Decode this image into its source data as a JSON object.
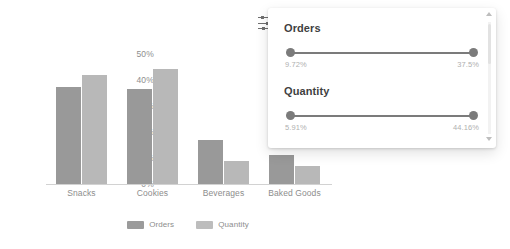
{
  "chart_data": {
    "type": "bar",
    "title": "",
    "xlabel": "",
    "ylabel": "",
    "categories": [
      "Snacks",
      "Cookies",
      "Beverages",
      "Baked Goods"
    ],
    "series": [
      {
        "name": "Orders",
        "color": "#999999",
        "values": [
          37.5,
          36.5,
          17.0,
          11.0
        ]
      },
      {
        "name": "Quantity",
        "color": "#b8b8b8",
        "values": [
          42.0,
          44.16,
          9.0,
          7.0
        ]
      }
    ],
    "ylim": [
      0,
      50
    ],
    "yticks": [
      "0%",
      "10%",
      "20%",
      "30%",
      "40%",
      "50%"
    ],
    "grid": false,
    "legend_position": "bottom"
  },
  "legend": {
    "items": [
      {
        "label": "Orders",
        "color": "#9b9b9b"
      },
      {
        "label": "Quantity",
        "color": "#bdbdbd"
      }
    ]
  },
  "filter_panel": {
    "icon": "filter-sliders-icon",
    "filters": [
      {
        "title": "Orders",
        "min_label": "9.72%",
        "max_label": "37.5%"
      },
      {
        "title": "Quantity",
        "min_label": "5.91%",
        "max_label": "44.16%"
      }
    ],
    "scrollbar": {
      "up_arrow": "chevron-up-icon",
      "down_arrow": "chevron-down-icon"
    }
  }
}
